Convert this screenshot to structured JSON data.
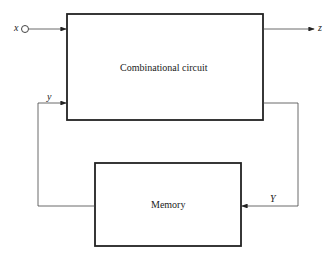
{
  "diagram": {
    "blocks": {
      "combinational": {
        "label": "Combinational circuit"
      },
      "memory": {
        "label": "Memory"
      }
    },
    "signals": {
      "input": "x",
      "output": "z",
      "feedback_in": "y",
      "feedback_out": "Y"
    }
  }
}
